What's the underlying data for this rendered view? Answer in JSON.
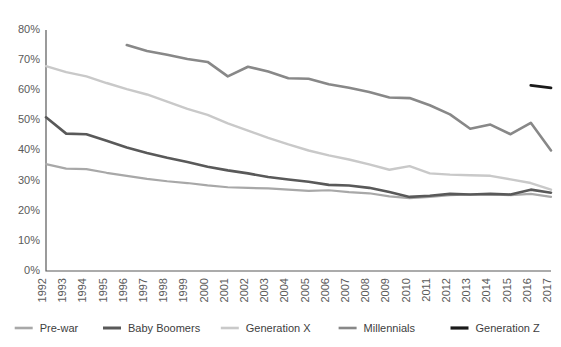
{
  "chart_data": {
    "type": "line",
    "title": "",
    "subtitle": "",
    "xlabel": "",
    "ylabel": "",
    "grid": false,
    "legend_position": "bottom",
    "ylim": [
      0,
      80
    ],
    "ytick_labels": [
      "0%",
      "10%",
      "20%",
      "30%",
      "40%",
      "50%",
      "60%",
      "70%",
      "80%"
    ],
    "ytick_values": [
      0,
      10,
      20,
      30,
      40,
      50,
      60,
      70,
      80
    ],
    "x": [
      1992,
      1993,
      1994,
      1995,
      1996,
      1997,
      1998,
      1999,
      2000,
      2001,
      2002,
      2003,
      2004,
      2005,
      2006,
      2007,
      2008,
      2009,
      2010,
      2011,
      2012,
      2013,
      2014,
      2015,
      2016,
      2017
    ],
    "xtick_labels": [
      "1992",
      "1993",
      "1994",
      "1995",
      "1996",
      "1997",
      "1998",
      "1999",
      "2000",
      "2001",
      "2002",
      "2003",
      "2004",
      "2005",
      "2006",
      "2007",
      "2008",
      "2009",
      "2010",
      "2011",
      "2012",
      "2013",
      "2014",
      "2015",
      "2016",
      "2017"
    ],
    "series": [
      {
        "name": "Pre-war",
        "color": "#a8a8a8",
        "width": 2.2,
        "values": [
          35.5,
          34.0,
          33.8,
          32.6,
          31.6,
          30.6,
          29.8,
          29.2,
          28.4,
          27.8,
          27.6,
          27.4,
          27.0,
          26.6,
          26.8,
          26.2,
          25.8,
          24.8,
          24.2,
          24.6,
          25.2,
          25.4,
          25.4,
          25.2,
          25.6,
          24.6
        ]
      },
      {
        "name": "Baby Boomers",
        "color": "#595959",
        "width": 2.6,
        "values": [
          51.0,
          45.6,
          45.4,
          43.2,
          41.0,
          39.2,
          37.6,
          36.2,
          34.6,
          33.4,
          32.4,
          31.2,
          30.4,
          29.6,
          28.6,
          28.4,
          27.6,
          26.2,
          24.6,
          25.0,
          25.6,
          25.4,
          25.6,
          25.4,
          27.0,
          26.0
        ]
      },
      {
        "name": "Generation X",
        "color": "#c9c9c9",
        "width": 2.4,
        "values": [
          68.0,
          66.0,
          64.6,
          62.4,
          60.4,
          58.6,
          56.2,
          53.8,
          51.8,
          49.0,
          46.6,
          44.2,
          42.0,
          40.0,
          38.4,
          37.0,
          35.4,
          33.6,
          34.8,
          32.4,
          32.0,
          31.8,
          31.6,
          30.4,
          29.2,
          27.0
        ]
      },
      {
        "name": "Millennials",
        "color": "#888888",
        "width": 2.6,
        "values": [
          null,
          null,
          null,
          null,
          75.0,
          73.0,
          71.8,
          70.4,
          69.4,
          64.6,
          67.8,
          66.2,
          64.0,
          63.8,
          62.0,
          60.8,
          59.4,
          57.6,
          57.4,
          55.0,
          52.0,
          47.2,
          48.6,
          45.4,
          49.2,
          40.0
        ]
      },
      {
        "name": "Generation Z",
        "color": "#1a1a1a",
        "width": 2.8,
        "values": [
          null,
          null,
          null,
          null,
          null,
          null,
          null,
          null,
          null,
          null,
          null,
          null,
          null,
          null,
          null,
          null,
          null,
          null,
          null,
          null,
          null,
          null,
          null,
          null,
          61.6,
          60.8
        ]
      }
    ]
  },
  "legend": {
    "items": [
      {
        "label": "Pre-war",
        "color": "#a8a8a8"
      },
      {
        "label": "Baby Boomers",
        "color": "#595959"
      },
      {
        "label": "Generation X",
        "color": "#c9c9c9"
      },
      {
        "label": "Millennials",
        "color": "#888888"
      },
      {
        "label": "Generation Z",
        "color": "#1a1a1a"
      }
    ]
  },
  "axis": {
    "line_color": "#595959"
  }
}
